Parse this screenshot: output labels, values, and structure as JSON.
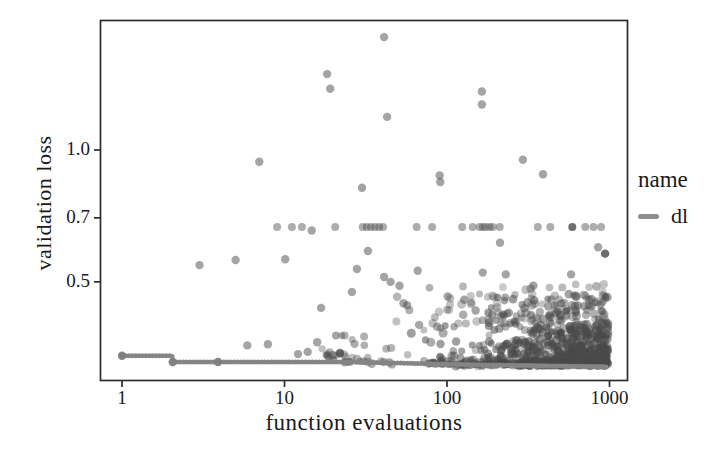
{
  "chart_data": {
    "type": "scatter",
    "xlabel": "function evaluations",
    "ylabel": "validation loss",
    "x_scale": "log",
    "y_scale": "log",
    "x_ticks": [
      1,
      10,
      100,
      1000
    ],
    "x_tick_labels": [
      "1",
      "10",
      "100",
      "1000"
    ],
    "y_ticks": [
      1.0,
      0.7,
      0.5
    ],
    "y_tick_labels": [
      "1.0",
      "0.7",
      "0.5"
    ],
    "x_range": [
      0.73,
      1300
    ],
    "y_range": [
      0.298,
      1.98
    ],
    "grid": false,
    "legend": {
      "title": "name",
      "position": "right",
      "entries": [
        {
          "label": "dl",
          "color": "#8e8e8e"
        }
      ]
    },
    "point_style": {
      "color": "#4a4a4a",
      "radius": 4.2,
      "opacity": 0.5
    },
    "axis_color": "#2b2b2b",
    "text_color": "#1a1a1a",
    "points": [
      [
        41,
        1.81
      ],
      [
        18.3,
        1.49
      ],
      [
        19.1,
        1.38
      ],
      [
        42.8,
        1.19
      ],
      [
        164,
        1.36
      ],
      [
        164,
        1.27
      ],
      [
        7,
        0.94
      ],
      [
        293,
        0.95
      ],
      [
        390,
        0.88
      ],
      [
        90,
        0.875
      ],
      [
        91,
        0.845
      ],
      [
        30,
        0.82
      ],
      [
        3.0,
        0.546
      ],
      [
        5.0,
        0.561
      ],
      [
        10.1,
        0.563
      ],
      [
        32.6,
        0.588
      ],
      [
        27.9,
        0.535
      ],
      [
        41,
        0.513
      ],
      [
        26,
        0.474
      ],
      [
        16.8,
        0.436
      ],
      [
        212,
        0.614
      ],
      [
        66,
        0.53
      ],
      [
        166,
        0.525
      ],
      [
        230,
        0.52
      ],
      [
        940,
        0.58,
        1.6
      ],
      [
        580,
        0.52
      ],
      [
        101,
        0.463
      ],
      [
        45,
        0.5
      ],
      [
        51,
        0.49
      ],
      [
        54,
        0.447
      ],
      [
        340,
        0.49
      ],
      [
        750,
        0.455
      ],
      [
        775,
        0.457
      ],
      [
        851,
        0.6
      ],
      [
        5.9,
        0.358
      ],
      [
        7.9,
        0.36
      ],
      [
        12.1,
        0.342
      ],
      [
        13.9,
        0.346
      ],
      [
        15.9,
        0.364
      ],
      [
        19.9,
        0.34
      ],
      [
        21.9,
        0.344,
        1.4
      ],
      [
        14.7,
        0.655
      ],
      [
        150,
        0.43
      ],
      [
        190,
        0.42
      ],
      [
        240,
        0.425
      ],
      [
        300,
        0.435
      ],
      [
        420,
        0.44
      ],
      [
        500,
        0.42
      ],
      [
        620,
        0.43
      ],
      [
        700,
        0.44
      ]
    ],
    "band": {
      "y": 0.667,
      "x": [
        9.0,
        11.1,
        12.8,
        20.5,
        30.3,
        32.1,
        34.0,
        36.0,
        38.2,
        40.4,
        65,
        81,
        124,
        144,
        159,
        166,
        173,
        183,
        191,
        211,
        362,
        432,
        590,
        710,
        797,
        888
      ],
      "dark_x": [
        590
      ]
    },
    "min_line": {
      "color": "#8e8e8e",
      "bead_color": "#848484",
      "vertices": [
        [
          1,
          0.339
        ],
        [
          2.05,
          0.339
        ],
        [
          2.05,
          0.328
        ],
        [
          25,
          0.328
        ],
        [
          55,
          0.326
        ],
        [
          140,
          0.3235
        ],
        [
          420,
          0.3215
        ],
        [
          980,
          0.32
        ]
      ],
      "knots": [
        [
          1,
          0.339
        ],
        [
          2.05,
          0.328
        ],
        [
          3.9,
          0.328
        ]
      ]
    },
    "generated_clusters": [
      {
        "count": 540,
        "xlog_min": 1.58,
        "xlog_max": 2.995,
        "x_bias": 0.42,
        "y_base": 0.323,
        "y_spread": 0.145,
        "y_pow": 3.0,
        "r_min": 3.4,
        "r_max": 4.6,
        "op_min": 0.32,
        "op_max": 0.55
      },
      {
        "count": 60,
        "xlog_min": 1.62,
        "xlog_max": 2.99,
        "x_bias": 0.55,
        "y_base": 0.4,
        "y_spread": 0.095,
        "y_pow": 1.6,
        "r_min": 3.4,
        "r_max": 4.4,
        "op_min": 0.28,
        "op_max": 0.45
      },
      {
        "count": 34,
        "xlog_min": 1.22,
        "xlog_max": 1.66,
        "x_bias": 1.0,
        "y_base": 0.327,
        "y_spread": 0.055,
        "y_pow": 2.6,
        "r_min": 3.4,
        "r_max": 4.4,
        "op_min": 0.35,
        "op_max": 0.5
      },
      {
        "count": 220,
        "xlog_min": 2.25,
        "xlog_max": 2.99,
        "x_bias": 0.5,
        "y_base": 0.325,
        "y_spread": 0.07,
        "y_pow": 2.2,
        "r_min": 3.4,
        "r_max": 4.6,
        "op_min": 0.5,
        "op_max": 0.7
      }
    ]
  }
}
